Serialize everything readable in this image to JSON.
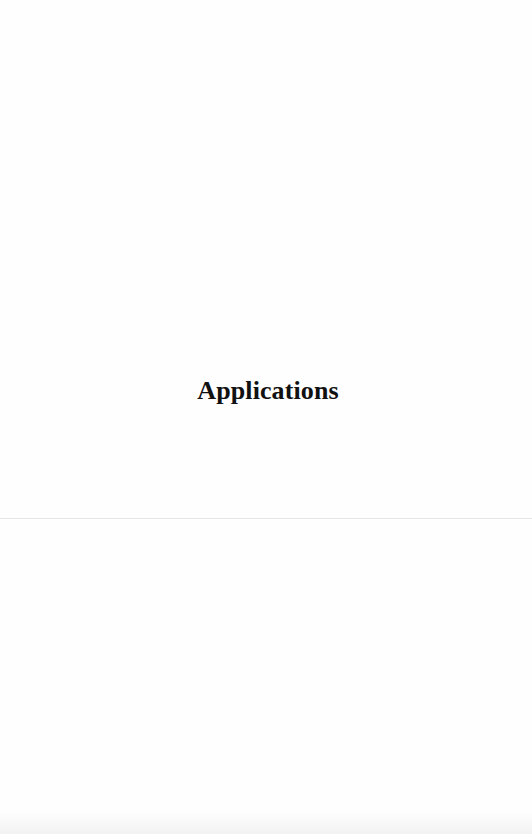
{
  "document": {
    "section_title": "Applications"
  }
}
